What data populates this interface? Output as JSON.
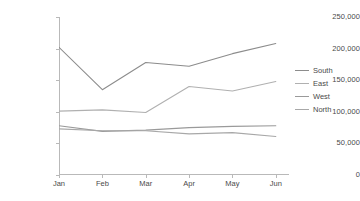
{
  "chart_data": {
    "type": "line",
    "title": "",
    "subtitle": "",
    "xlabel": "",
    "ylabel": "",
    "categories": [
      "Jan",
      "Feb",
      "Mar",
      "Apr",
      "May",
      "Jun"
    ],
    "ylim": [
      0,
      250000
    ],
    "y_ticks": [
      0,
      50000,
      100000,
      150000,
      200000,
      250000
    ],
    "y_tick_labels": [
      "0",
      "50,000",
      "100,000",
      "150,000",
      "200,000",
      "250,000"
    ],
    "grid": false,
    "legend_position": "right",
    "series": [
      {
        "name": "South",
        "color": "#8c8c8c",
        "values": [
          202000,
          135000,
          178000,
          172000,
          192000,
          208000
        ]
      },
      {
        "name": "East",
        "color": "#b0b0b0",
        "values": [
          101000,
          103000,
          99000,
          140000,
          133000,
          148000
        ]
      },
      {
        "name": "West",
        "color": "#9a9a9a",
        "values": [
          78000,
          69000,
          71000,
          75000,
          77000,
          78000
        ]
      },
      {
        "name": "North",
        "color": "#a8a8a8",
        "values": [
          73000,
          70000,
          70000,
          65000,
          67000,
          61000
        ]
      }
    ]
  },
  "legend": {
    "items": [
      {
        "label": "South"
      },
      {
        "label": "East"
      },
      {
        "label": "West"
      },
      {
        "label": "North"
      }
    ]
  },
  "axes": {
    "y_labels": [
      "250,000",
      "200,000",
      "150,000",
      "100,000",
      "50,000",
      "0"
    ],
    "x_labels": [
      "Jan",
      "Feb",
      "Mar",
      "Apr",
      "May",
      "Jun"
    ]
  },
  "colors": {
    "background": "#ffffff",
    "axis": "#b9b9b9",
    "text": "#4a4a4a"
  }
}
